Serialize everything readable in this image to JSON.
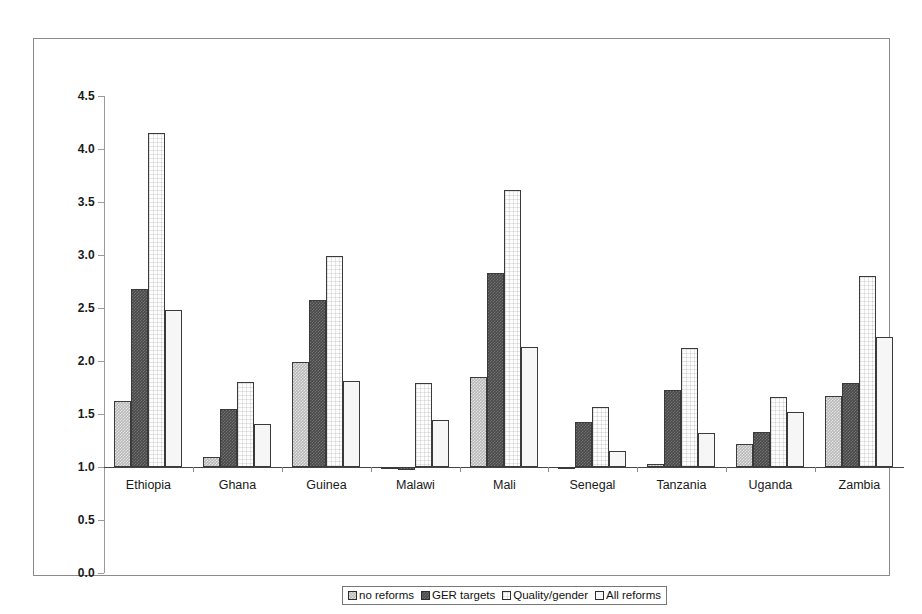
{
  "chart_data": {
    "type": "bar",
    "title": "",
    "subtitle": "",
    "xlabel": "",
    "ylabel": "",
    "ylim": [
      0.0,
      4.5
    ],
    "ytick_labels": [
      "4.5",
      "4.0",
      "3.5",
      "3.0",
      "2.5",
      "2.0",
      "1.5",
      "1.0",
      "0.5",
      "0.0"
    ],
    "ytick_values": [
      4.5,
      4.0,
      3.5,
      3.0,
      2.5,
      2.0,
      1.5,
      1.0,
      0.5,
      0.0
    ],
    "baseline": 1.0,
    "grid": false,
    "legend_position": "bottom-center",
    "categories": [
      "Ethiopia",
      "Ghana",
      "Guinea",
      "Malawi",
      "Mali",
      "Senegal",
      "Tanzania",
      "Uganda",
      "Zambia"
    ],
    "series": [
      {
        "name": "no reforms",
        "color": "#b9b9b9",
        "values": [
          1.62,
          1.09,
          1.99,
          0.98,
          1.85,
          0.99,
          1.03,
          1.22,
          1.67
        ]
      },
      {
        "name": "GER targets",
        "color": "#4a4a4a",
        "values": [
          2.68,
          1.55,
          2.58,
          0.97,
          2.83,
          1.42,
          1.73,
          1.33,
          1.79
        ]
      },
      {
        "name": "Quality/gender",
        "color": "#fdfdfd",
        "values": [
          4.15,
          1.8,
          2.99,
          1.79,
          3.61,
          1.57,
          2.12,
          1.66,
          2.8
        ]
      },
      {
        "name": "All reforms",
        "color": "#f6f6f6",
        "values": [
          2.48,
          1.41,
          1.81,
          1.44,
          2.13,
          1.15,
          1.32,
          1.52,
          2.23
        ]
      }
    ]
  },
  "legend": {
    "items": [
      {
        "label": "no reforms"
      },
      {
        "label": "GER targets"
      },
      {
        "label": "Quality/gender"
      },
      {
        "label": "All reforms"
      }
    ]
  }
}
